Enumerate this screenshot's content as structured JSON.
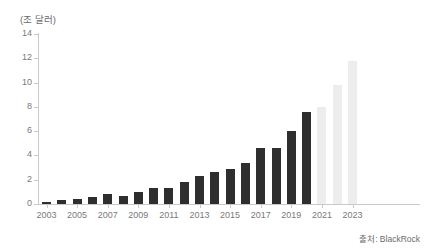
{
  "chart_data": {
    "type": "bar",
    "title": "",
    "subtitle": "",
    "unit_label": "(조 달러)",
    "xlabel": "",
    "ylabel": "",
    "ylim": [
      0,
      14
    ],
    "ytick_values": [
      0,
      2,
      4,
      6,
      8,
      10,
      12,
      14
    ],
    "ytick_labels": [
      "0",
      "2",
      "4",
      "6",
      "8",
      "10",
      "12",
      "14"
    ],
    "grid": false,
    "legend": "none",
    "categories": [
      "2003",
      "2004",
      "2005",
      "2006",
      "2007",
      "2008",
      "2009",
      "2010",
      "2011",
      "2012",
      "2013",
      "2014",
      "2015",
      "2016",
      "2017",
      "2018",
      "2019",
      "2020",
      "2021",
      "2022",
      "2023"
    ],
    "xtick_labels": [
      "2003",
      "2005",
      "2007",
      "2009",
      "2011",
      "2013",
      "2015",
      "2017",
      "2019",
      "2021",
      "2023"
    ],
    "values": [
      0.2,
      0.3,
      0.4,
      0.6,
      0.8,
      0.7,
      1.0,
      1.3,
      1.3,
      1.8,
      2.3,
      2.6,
      2.9,
      3.4,
      4.6,
      4.6,
      6.0,
      7.6,
      8.0,
      9.8,
      11.8
    ],
    "series": [
      {
        "name": "실적",
        "values": [
          0.2,
          0.3,
          0.4,
          0.6,
          0.8,
          0.7,
          1.0,
          1.3,
          1.3,
          1.8,
          2.3,
          2.6,
          2.9,
          3.4,
          4.6,
          4.6,
          6.0,
          7.6,
          null,
          null,
          null
        ],
        "color": "#2e2e2e"
      },
      {
        "name": "전망",
        "values": [
          null,
          null,
          null,
          null,
          null,
          null,
          null,
          null,
          null,
          null,
          null,
          null,
          null,
          null,
          null,
          null,
          null,
          null,
          8.0,
          9.8,
          11.8
        ],
        "color": "#ededed"
      }
    ],
    "colors": {
      "actual_bar": "#2e2e2e",
      "projected_bar": "#ededed",
      "axis": "#c9c9c9",
      "text": "#7a7a7a"
    },
    "annotations": []
  },
  "footer": {
    "source": "출처: BlackRock"
  }
}
